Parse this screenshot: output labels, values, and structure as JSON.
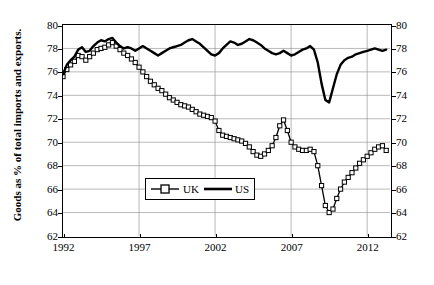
{
  "chart_data": {
    "type": "line",
    "title": "",
    "xlabel": "",
    "ylabel": "Goods as % of total imports and exports.",
    "xlim": [
      1992,
      2013.5
    ],
    "ylim": [
      62,
      80
    ],
    "ytick_labels": [
      "62",
      "64",
      "66",
      "68",
      "70",
      "72",
      "74",
      "76",
      "78",
      "80"
    ],
    "ytick_values": [
      62,
      64,
      66,
      68,
      70,
      72,
      74,
      76,
      78,
      80
    ],
    "xtick_labels": [
      "1992",
      "1997",
      "2002",
      "2007",
      "2012"
    ],
    "xtick_values": [
      1992,
      1997,
      2002,
      2007,
      2012
    ],
    "grid": true,
    "legend_position": "inside-bottom-left",
    "legend": [
      "UK",
      "US"
    ],
    "series": [
      {
        "name": "UK",
        "marker": "square-open",
        "values": [
          [
            1992.0,
            75.6
          ],
          [
            1992.25,
            76.2
          ],
          [
            1992.5,
            76.6
          ],
          [
            1992.75,
            76.9
          ],
          [
            1993.0,
            77.4
          ],
          [
            1993.25,
            77.3
          ],
          [
            1993.5,
            77.0
          ],
          [
            1993.75,
            77.3
          ],
          [
            1994.0,
            77.6
          ],
          [
            1994.25,
            77.9
          ],
          [
            1994.5,
            78.0
          ],
          [
            1994.75,
            78.1
          ],
          [
            1995.0,
            78.3
          ],
          [
            1995.25,
            78.5
          ],
          [
            1995.5,
            78.2
          ],
          [
            1995.75,
            77.9
          ],
          [
            1996.0,
            77.6
          ],
          [
            1996.25,
            77.4
          ],
          [
            1996.5,
            77.1
          ],
          [
            1996.75,
            76.8
          ],
          [
            1997.0,
            76.4
          ],
          [
            1997.25,
            76.0
          ],
          [
            1997.5,
            75.6
          ],
          [
            1997.75,
            75.2
          ],
          [
            1998.0,
            74.9
          ],
          [
            1998.25,
            74.6
          ],
          [
            1998.5,
            74.4
          ],
          [
            1998.75,
            74.1
          ],
          [
            1999.0,
            73.8
          ],
          [
            1999.25,
            73.6
          ],
          [
            1999.5,
            73.4
          ],
          [
            1999.75,
            73.2
          ],
          [
            2000.0,
            73.1
          ],
          [
            2000.25,
            73.0
          ],
          [
            2000.5,
            72.8
          ],
          [
            2000.75,
            72.6
          ],
          [
            2001.0,
            72.4
          ],
          [
            2001.25,
            72.3
          ],
          [
            2001.5,
            72.2
          ],
          [
            2001.75,
            72.1
          ],
          [
            2002.0,
            71.8
          ],
          [
            2002.25,
            71.0
          ],
          [
            2002.5,
            70.6
          ],
          [
            2002.75,
            70.5
          ],
          [
            2003.0,
            70.4
          ],
          [
            2003.25,
            70.3
          ],
          [
            2003.5,
            70.2
          ],
          [
            2003.75,
            70.1
          ],
          [
            2004.0,
            69.9
          ],
          [
            2004.25,
            69.6
          ],
          [
            2004.5,
            69.2
          ],
          [
            2004.75,
            68.9
          ],
          [
            2005.0,
            68.8
          ],
          [
            2005.25,
            69.0
          ],
          [
            2005.5,
            69.3
          ],
          [
            2005.75,
            69.7
          ],
          [
            2006.0,
            70.4
          ],
          [
            2006.25,
            71.4
          ],
          [
            2006.5,
            71.9
          ],
          [
            2006.75,
            71.0
          ],
          [
            2007.0,
            70.0
          ],
          [
            2007.25,
            69.6
          ],
          [
            2007.5,
            69.4
          ],
          [
            2007.75,
            69.3
          ],
          [
            2008.0,
            69.3
          ],
          [
            2008.25,
            69.4
          ],
          [
            2008.5,
            69.2
          ],
          [
            2008.75,
            68.0
          ],
          [
            2009.0,
            66.3
          ],
          [
            2009.25,
            64.6
          ],
          [
            2009.5,
            64.0
          ],
          [
            2009.75,
            64.3
          ],
          [
            2010.0,
            65.2
          ],
          [
            2010.25,
            66.0
          ],
          [
            2010.5,
            66.6
          ],
          [
            2010.75,
            67.0
          ],
          [
            2011.0,
            67.4
          ],
          [
            2011.25,
            67.8
          ],
          [
            2011.5,
            68.2
          ],
          [
            2011.75,
            68.5
          ],
          [
            2012.0,
            68.8
          ],
          [
            2012.25,
            69.1
          ],
          [
            2012.5,
            69.4
          ],
          [
            2012.75,
            69.6
          ],
          [
            2013.0,
            69.7
          ],
          [
            2013.25,
            69.3
          ]
        ]
      },
      {
        "name": "US",
        "marker": "none",
        "values": [
          [
            1992.0,
            75.8
          ],
          [
            1992.25,
            76.6
          ],
          [
            1992.5,
            77.0
          ],
          [
            1992.75,
            77.3
          ],
          [
            1993.0,
            77.9
          ],
          [
            1993.25,
            78.1
          ],
          [
            1993.5,
            77.7
          ],
          [
            1993.75,
            77.8
          ],
          [
            1994.0,
            78.2
          ],
          [
            1994.25,
            78.5
          ],
          [
            1994.5,
            78.7
          ],
          [
            1994.75,
            78.6
          ],
          [
            1995.0,
            78.8
          ],
          [
            1995.25,
            78.9
          ],
          [
            1995.5,
            78.5
          ],
          [
            1995.75,
            78.2
          ],
          [
            1996.0,
            78.0
          ],
          [
            1996.25,
            78.1
          ],
          [
            1996.5,
            78.0
          ],
          [
            1996.75,
            77.8
          ],
          [
            1997.0,
            78.0
          ],
          [
            1997.25,
            78.2
          ],
          [
            1997.5,
            78.0
          ],
          [
            1997.75,
            77.8
          ],
          [
            1998.0,
            77.6
          ],
          [
            1998.25,
            77.4
          ],
          [
            1998.5,
            77.6
          ],
          [
            1998.75,
            77.8
          ],
          [
            1999.0,
            78.0
          ],
          [
            1999.25,
            78.1
          ],
          [
            1999.5,
            78.2
          ],
          [
            1999.75,
            78.3
          ],
          [
            2000.0,
            78.5
          ],
          [
            2000.25,
            78.7
          ],
          [
            2000.5,
            78.8
          ],
          [
            2000.75,
            78.6
          ],
          [
            2001.0,
            78.4
          ],
          [
            2001.25,
            78.1
          ],
          [
            2001.5,
            77.8
          ],
          [
            2001.75,
            77.5
          ],
          [
            2002.0,
            77.4
          ],
          [
            2002.25,
            77.6
          ],
          [
            2002.5,
            78.0
          ],
          [
            2002.75,
            78.3
          ],
          [
            2003.0,
            78.6
          ],
          [
            2003.25,
            78.5
          ],
          [
            2003.5,
            78.3
          ],
          [
            2003.75,
            78.4
          ],
          [
            2004.0,
            78.6
          ],
          [
            2004.25,
            78.8
          ],
          [
            2004.5,
            78.7
          ],
          [
            2004.75,
            78.5
          ],
          [
            2005.0,
            78.3
          ],
          [
            2005.25,
            78.0
          ],
          [
            2005.5,
            77.8
          ],
          [
            2005.75,
            77.6
          ],
          [
            2006.0,
            77.5
          ],
          [
            2006.25,
            77.6
          ],
          [
            2006.5,
            77.8
          ],
          [
            2006.75,
            77.6
          ],
          [
            2007.0,
            77.4
          ],
          [
            2007.25,
            77.5
          ],
          [
            2007.5,
            77.7
          ],
          [
            2007.75,
            77.9
          ],
          [
            2008.0,
            78.0
          ],
          [
            2008.25,
            78.2
          ],
          [
            2008.5,
            77.9
          ],
          [
            2008.75,
            76.8
          ],
          [
            2009.0,
            75.0
          ],
          [
            2009.25,
            73.6
          ],
          [
            2009.5,
            73.4
          ],
          [
            2009.75,
            74.6
          ],
          [
            2010.0,
            75.8
          ],
          [
            2010.25,
            76.6
          ],
          [
            2010.5,
            77.0
          ],
          [
            2010.75,
            77.2
          ],
          [
            2011.0,
            77.3
          ],
          [
            2011.25,
            77.5
          ],
          [
            2011.5,
            77.6
          ],
          [
            2011.75,
            77.7
          ],
          [
            2012.0,
            77.8
          ],
          [
            2012.25,
            77.9
          ],
          [
            2012.5,
            78.0
          ],
          [
            2012.75,
            77.9
          ],
          [
            2013.0,
            77.8
          ],
          [
            2013.25,
            77.9
          ]
        ]
      }
    ]
  }
}
